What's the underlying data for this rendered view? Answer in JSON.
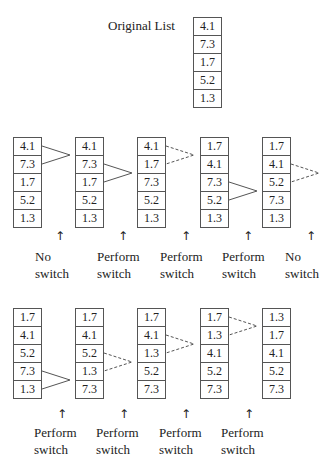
{
  "original": {
    "title": "Original List",
    "values": [
      "4.1",
      "7.3",
      "1.7",
      "5.2",
      "1.3"
    ]
  },
  "row1": {
    "lists": [
      [
        "4.1",
        "7.3",
        "1.7",
        "5.2",
        "1.3"
      ],
      [
        "4.1",
        "7.3",
        "1.7",
        "5.2",
        "1.3"
      ],
      [
        "4.1",
        "1.7",
        "7.3",
        "5.2",
        "1.3"
      ],
      [
        "1.7",
        "4.1",
        "7.3",
        "5.2",
        "1.3"
      ],
      [
        "1.7",
        "4.1",
        "5.2",
        "7.3",
        "1.3"
      ]
    ],
    "labels": [
      {
        "line1": "No",
        "line2": "switch"
      },
      {
        "line1": "Perform",
        "line2": "switch"
      },
      {
        "line1": "Perform",
        "line2": "switch"
      },
      {
        "line1": "Perform",
        "line2": "switch"
      },
      {
        "line1": "No",
        "line2": "switch"
      }
    ]
  },
  "row2": {
    "lists": [
      [
        "1.7",
        "4.1",
        "5.2",
        "7.3",
        "1.3"
      ],
      [
        "1.7",
        "4.1",
        "5.2",
        "1.3",
        "7.3"
      ],
      [
        "1.7",
        "4.1",
        "1.3",
        "5.2",
        "7.3"
      ],
      [
        "1.7",
        "1.3",
        "4.1",
        "5.2",
        "7.3"
      ],
      [
        "1.3",
        "1.7",
        "4.1",
        "5.2",
        "7.3"
      ]
    ],
    "labels": [
      {
        "line1": "Perform",
        "line2": "switch"
      },
      {
        "line1": "Perform",
        "line2": "switch"
      },
      {
        "line1": "Perform",
        "line2": "switch"
      },
      {
        "line1": "Perform",
        "line2": "switch"
      }
    ]
  },
  "arrow_glyph": "↑"
}
